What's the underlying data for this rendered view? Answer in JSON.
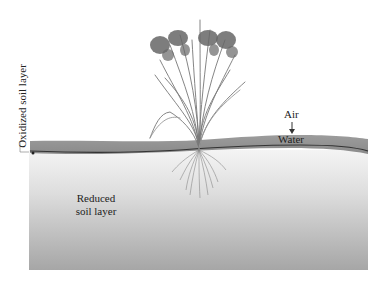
{
  "diagram": {
    "labels": {
      "oxidized": "Oxidized soil layer",
      "air": "Air",
      "water": "Water",
      "reduced": "Reduced soil layer"
    },
    "colors": {
      "water_band": "#8e8e8e",
      "water_line": "#333333",
      "soil_top": "#f2f2f2",
      "soil_bottom": "#a9a9a9",
      "plant": "#6f6f6f",
      "panicle": "#555555"
    }
  }
}
